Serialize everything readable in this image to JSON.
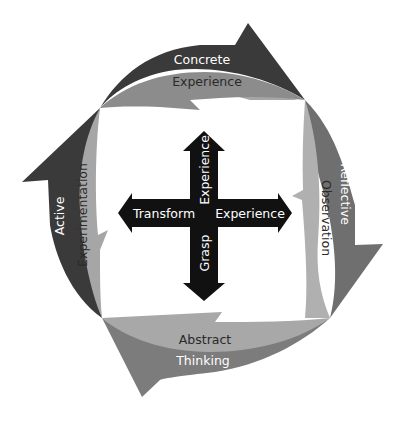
{
  "colors": {
    "background": "#ffffff",
    "dark_band": "#3a3a3a",
    "mid_band": "#7c7c7c",
    "light_band": "#a6a6a6",
    "cross": "#111111",
    "white_text": "#ffffff",
    "dark_text": "#2a2a2a"
  },
  "cycle": {
    "top": {
      "outer": "Concrete",
      "inner": "Experience"
    },
    "right": {
      "outer": "Reflective",
      "inner": "Observation"
    },
    "bottom": {
      "outer": "Thinking",
      "inner": "Abstract"
    },
    "left": {
      "outer": "Active",
      "inner": "Experimentation"
    }
  },
  "cross": {
    "left_label": "Transform",
    "right_label": "Experience",
    "up_label": "Experience",
    "down_label": "Grasp"
  }
}
